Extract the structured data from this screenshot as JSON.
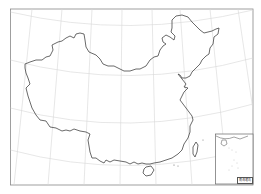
{
  "map": {
    "title": "China outline map (blank)",
    "type": "outline-map",
    "region": "China",
    "colors": {
      "background": "#ffffff",
      "frame": "#888888",
      "graticule": "#d6d6d6",
      "border": "#444444"
    },
    "graticule": {
      "parallels": 4,
      "meridians": 7
    },
    "inset": {
      "label": "南海诸岛",
      "description": "South China Sea islands inset"
    }
  }
}
